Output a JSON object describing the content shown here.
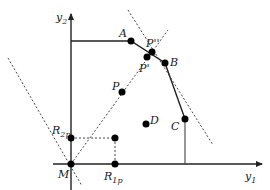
{
  "diagram": {
    "axes": {
      "x_label": "y",
      "x_label_sub": "1",
      "y_label": "y",
      "y_label_sub": "2"
    },
    "points": [
      {
        "id": "A",
        "label": "A",
        "sub": ""
      },
      {
        "id": "B",
        "label": "B",
        "sub": ""
      },
      {
        "id": "C",
        "label": "C",
        "sub": ""
      },
      {
        "id": "D",
        "label": "D",
        "sub": ""
      },
      {
        "id": "P",
        "label": "P",
        "sub": ""
      },
      {
        "id": "P_prime",
        "label": "P'",
        "sub": ""
      },
      {
        "id": "P_double_prime",
        "label": "P''",
        "sub": ""
      },
      {
        "id": "M",
        "label": "M",
        "sub": ""
      },
      {
        "id": "R2p",
        "label": "R",
        "sub": "2p"
      },
      {
        "id": "R1p",
        "label": "R",
        "sub": "1p"
      }
    ],
    "colors": {
      "line": "#222222",
      "dot": "#000000",
      "background": "#ffffff"
    }
  }
}
